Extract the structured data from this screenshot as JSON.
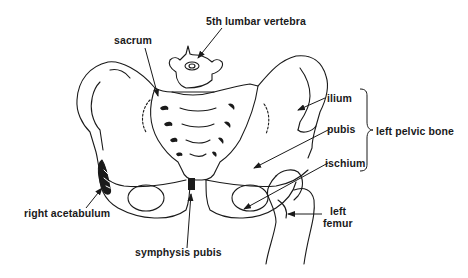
{
  "diagram": {
    "labels": {
      "vertebra": "5th lumbar vertebra",
      "sacrum": "sacrum",
      "ilium": "ilium",
      "pubis": "pubis",
      "ischium": "ischium",
      "left_pelvic_bone": "left pelvic bone",
      "right_acetabulum": "right acetabulum",
      "symphysis_pubis": "symphysis pubis",
      "left_femur_line1": "left",
      "left_femur_line2": "femur"
    },
    "colors": {
      "line": "#1a1a1a",
      "background": "#ffffff"
    }
  }
}
